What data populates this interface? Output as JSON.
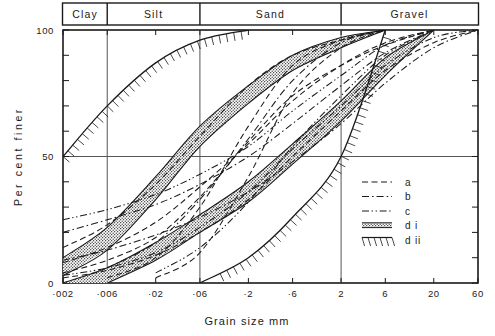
{
  "figure": {
    "xlabel": "Grain size    mm",
    "ylabel": "Per cent finer"
  },
  "classification": {
    "bands": [
      {
        "name": "Clay",
        "label": "Clay"
      },
      {
        "name": "Silt",
        "label": "Silt"
      },
      {
        "name": "Sand",
        "label": "Sand"
      },
      {
        "name": "Gravel",
        "label": "Gravel"
      }
    ]
  },
  "legend": {
    "items": [
      {
        "key": "a",
        "label": "a",
        "style": "dashed"
      },
      {
        "key": "b",
        "label": "b",
        "style": "dash-dot"
      },
      {
        "key": "c",
        "label": "c",
        "style": "dash-dot-dot"
      },
      {
        "key": "di",
        "label": "d i",
        "style": "stipple-band"
      },
      {
        "key": "dii",
        "label": "d ii",
        "style": "hatch-band"
      }
    ]
  },
  "axes": {
    "x_ticklabels": [
      "·002",
      "·006",
      "·02",
      "·06",
      "·2",
      "·6",
      "2",
      "6",
      "20",
      "60"
    ],
    "y_ticklabels": [
      "0",
      "50",
      "100"
    ]
  },
  "chart_data": {
    "type": "line",
    "title": "",
    "xlabel": "Grain size    mm",
    "ylabel": "Per cent finer",
    "xscale": "log",
    "xlim": [
      0.002,
      60
    ],
    "ylim": [
      0,
      100
    ],
    "xticks": [
      0.002,
      0.006,
      0.02,
      0.06,
      0.2,
      0.6,
      2,
      6,
      20,
      60
    ],
    "xticklabels": [
      "·002",
      "·006",
      "·02",
      "·06",
      "·2",
      "·6",
      "2",
      "6",
      "20",
      "60"
    ],
    "yticks": [
      0,
      10,
      20,
      30,
      40,
      50,
      60,
      70,
      80,
      90,
      100
    ],
    "yticklabels": [
      "0",
      "50",
      "100"
    ],
    "grid": "major-vertical-at-soil-boundaries-and-y50",
    "soil_boundaries": [
      {
        "label": "Clay",
        "x_from": 0.002,
        "x_to": 0.006
      },
      {
        "label": "Silt",
        "x_from": 0.006,
        "x_to": 0.06
      },
      {
        "label": "Sand",
        "x_from": 0.06,
        "x_to": 2
      },
      {
        "label": "Gravel",
        "x_from": 2,
        "x_to": 60
      }
    ],
    "legend_position": "lower-right-inside",
    "series": [
      {
        "name": "a1",
        "style": "dashed",
        "legend": "a",
        "x": [
          0.002,
          0.006,
          0.02,
          0.06,
          0.2,
          0.6,
          2,
          6
        ],
        "y": [
          14,
          23,
          39,
          58,
          78,
          90,
          96,
          100
        ]
      },
      {
        "name": "a2",
        "style": "dashed",
        "legend": "a",
        "x": [
          0.002,
          0.006,
          0.02,
          0.06,
          0.2,
          0.6,
          2,
          6,
          20
        ],
        "y": [
          4,
          9,
          18,
          34,
          56,
          74,
          86,
          94,
          100
        ]
      },
      {
        "name": "a3",
        "style": "dashed",
        "legend": "a",
        "x": [
          0.006,
          0.02,
          0.06,
          0.2,
          0.6,
          2,
          6
        ],
        "y": [
          2,
          10,
          30,
          62,
          86,
          96,
          100
        ]
      },
      {
        "name": "a4",
        "style": "dashed",
        "legend": "a",
        "x": [
          0.002,
          0.006,
          0.02,
          0.06,
          0.2,
          0.6,
          2,
          6,
          20,
          60
        ],
        "y": [
          2,
          5,
          11,
          20,
          33,
          50,
          68,
          84,
          95,
          100
        ]
      },
      {
        "name": "a5",
        "style": "dashed",
        "legend": "a",
        "x": [
          0.02,
          0.06,
          0.2,
          0.6,
          2,
          6
        ],
        "y": [
          2,
          12,
          42,
          75,
          93,
          100
        ]
      },
      {
        "name": "a6",
        "style": "dashed",
        "legend": "a",
        "x": [
          0.002,
          0.006,
          0.02,
          0.06,
          0.2,
          0.6,
          2,
          6,
          20
        ],
        "y": [
          8,
          14,
          24,
          38,
          55,
          72,
          86,
          95,
          100
        ]
      },
      {
        "name": "b1",
        "style": "dash-dot",
        "legend": "b",
        "x": [
          0.002,
          0.006,
          0.02,
          0.06,
          0.2,
          0.6,
          2,
          6,
          20
        ],
        "y": [
          20,
          25,
          31,
          39,
          50,
          63,
          78,
          91,
          100
        ]
      },
      {
        "name": "b2",
        "style": "dash-dot",
        "legend": "b",
        "x": [
          0.002,
          0.006,
          0.02,
          0.06,
          0.2,
          0.6,
          2,
          6,
          20,
          60
        ],
        "y": [
          9,
          13,
          19,
          26,
          36,
          48,
          63,
          79,
          93,
          100
        ]
      },
      {
        "name": "b3",
        "style": "dash-dot",
        "legend": "b",
        "x": [
          0.006,
          0.02,
          0.06,
          0.2,
          0.6,
          2,
          6
        ],
        "y": [
          6,
          16,
          33,
          57,
          80,
          95,
          100
        ]
      },
      {
        "name": "c1",
        "style": "dash-dot-dot",
        "legend": "c",
        "x": [
          0.002,
          0.006,
          0.02,
          0.06,
          0.2,
          0.6,
          2,
          6,
          20
        ],
        "y": [
          25,
          29,
          35,
          43,
          54,
          68,
          82,
          94,
          100
        ]
      },
      {
        "name": "c2",
        "style": "dash-dot-dot",
        "legend": "c",
        "x": [
          0.002,
          0.006,
          0.02,
          0.06,
          0.2,
          0.6,
          2,
          6,
          20,
          60
        ],
        "y": [
          3,
          6,
          12,
          22,
          36,
          53,
          70,
          86,
          97,
          100
        ]
      },
      {
        "name": "c3",
        "style": "dash-dot-dot",
        "legend": "c",
        "x": [
          0.02,
          0.06,
          0.2,
          0.6,
          2,
          6,
          20
        ],
        "y": [
          4,
          14,
          32,
          54,
          74,
          90,
          100
        ]
      }
    ],
    "bands": [
      {
        "name": "di-upper",
        "legend": "d i",
        "fill": "stipple",
        "upper": {
          "x": [
            0.002,
            0.006,
            0.02,
            0.06,
            0.2,
            0.6,
            2,
            6
          ],
          "y": [
            10,
            22,
            42,
            62,
            78,
            90,
            97,
            100
          ]
        },
        "lower": {
          "x": [
            0.002,
            0.006,
            0.02,
            0.06,
            0.2,
            0.6,
            2,
            6
          ],
          "y": [
            3,
            13,
            33,
            54,
            71,
            84,
            93,
            100
          ]
        }
      },
      {
        "name": "di-lower",
        "legend": "d i",
        "fill": "stipple",
        "upper": {
          "x": [
            0.002,
            0.006,
            0.02,
            0.06,
            0.2,
            0.6,
            2,
            6,
            20
          ],
          "y": [
            0,
            6,
            16,
            27,
            40,
            55,
            72,
            89,
            100
          ]
        },
        "lower": {
          "x": [
            0.006,
            0.02,
            0.06,
            0.2,
            0.6,
            2,
            6,
            20
          ],
          "y": [
            0,
            9,
            20,
            32,
            47,
            64,
            82,
            100
          ]
        }
      },
      {
        "name": "dii-upper",
        "legend": "d ii",
        "fill": "hatch",
        "upper": {
          "x": [
            0.002,
            0.006,
            0.02,
            0.06,
            0.2
          ],
          "y": [
            50,
            70,
            87,
            96,
            100
          ]
        }
      },
      {
        "name": "dii-lower",
        "legend": "d ii",
        "fill": "hatch",
        "upper": {
          "x": [
            0.06,
            0.2,
            0.6,
            2,
            6
          ],
          "y": [
            0,
            10,
            26,
            50,
            100
          ]
        }
      }
    ]
  }
}
